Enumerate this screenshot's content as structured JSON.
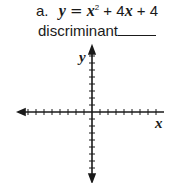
{
  "problem": {
    "label": "a.",
    "equation": {
      "lhs": "y",
      "equals": "=",
      "term1_var": "x",
      "term1_exp": "2",
      "plus1": "+",
      "term2": "4x",
      "plus2": "+",
      "constant": "4"
    },
    "prompt": "discriminant"
  },
  "graph": {
    "x_label": "x",
    "y_label": "y",
    "ticks_per_half_axis": 8,
    "color": "#1a1a1a"
  }
}
